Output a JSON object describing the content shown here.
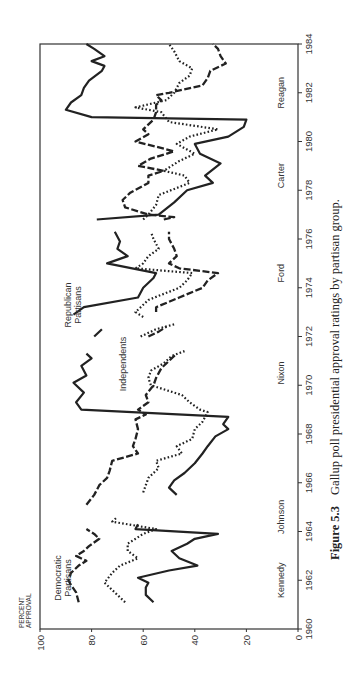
{
  "chart_data": {
    "type": "line",
    "title": "Gallup poll presidential approval ratings by partisan group.",
    "caption_label": "Figure 5.3",
    "caption_text": "Gallup poll presidential approval ratings by partisan group.",
    "ylabel": "PERCENT APPROVAL",
    "ylabel_lines": [
      "PERCENT",
      "APPROVAL"
    ],
    "xlabel": "",
    "xlim": [
      1960,
      1984
    ],
    "ylim": [
      0,
      100
    ],
    "x_ticks": [
      "1960",
      "1962",
      "1964",
      "1966",
      "1968",
      "1970",
      "1972",
      "1974",
      "1976",
      "1978",
      "1980",
      "1982",
      "1984"
    ],
    "y_ticks": [
      "0",
      "20",
      "40",
      "60",
      "80",
      "100"
    ],
    "grid": false,
    "orientation": "rotated 90° (page printed sideways)",
    "presidents": [
      {
        "name": "Kennedy",
        "year": 1962.0
      },
      {
        "name": "Johnson",
        "year": 1964.6
      },
      {
        "name": "Nixon",
        "year": 1970.5
      },
      {
        "name": "Ford",
        "year": 1974.6
      },
      {
        "name": "Carter",
        "year": 1978.6
      },
      {
        "name": "Reagan",
        "year": 1982.0
      }
    ],
    "series": [
      {
        "name": "Democratic Partisans",
        "label_lines": [
          "Democratic",
          "Partisans"
        ],
        "style": "dashed",
        "segments": [
          [
            [
              1961.1,
              85
            ],
            [
              1961.5,
              86
            ],
            [
              1961.8,
              88
            ],
            [
              1962.0,
              89
            ],
            [
              1962.3,
              88
            ],
            [
              1962.6,
              85
            ],
            [
              1962.8,
              82
            ],
            [
              1963.0,
              86
            ],
            [
              1963.2,
              83
            ],
            [
              1963.4,
              81
            ],
            [
              1963.7,
              77
            ],
            [
              1963.9,
              79
            ],
            [
              1964.1,
              82
            ]
          ],
          [
            [
              1964.3,
              81
            ]
          ],
          [
            [
              1965.1,
              82
            ],
            [
              1965.5,
              79
            ],
            [
              1965.9,
              77
            ],
            [
              1966.2,
              74
            ],
            [
              1966.5,
              73
            ],
            [
              1966.9,
              72
            ],
            [
              1967.2,
              62
            ],
            [
              1967.5,
              64
            ],
            [
              1967.8,
              63
            ],
            [
              1968.2,
              62
            ],
            [
              1968.6,
              63
            ],
            [
              1968.8,
              59
            ],
            [
              1969.0,
              62
            ],
            [
              1969.3,
              58
            ],
            [
              1969.6,
              59
            ],
            [
              1970.0,
              56
            ],
            [
              1970.3,
              55
            ],
            [
              1970.7,
              53
            ],
            [
              1971.0,
              50
            ],
            [
              1971.3,
              47
            ]
          ],
          [
            [
              1972.0,
              58
            ],
            [
              1972.2,
              54
            ],
            [
              1972.4,
              51
            ]
          ],
          [
            [
              1973.0,
              55
            ],
            [
              1973.2,
              55
            ],
            [
              1973.6,
              46
            ],
            [
              1974.0,
              37
            ],
            [
              1974.3,
              35
            ],
            [
              1974.6,
              31
            ],
            [
              1974.8,
              46
            ],
            [
              1975.0,
              50
            ],
            [
              1975.3,
              47
            ],
            [
              1975.6,
              48
            ],
            [
              1976.0,
              50
            ],
            [
              1976.3,
              50
            ]
          ],
          [
            [
              1976.8,
              52
            ],
            [
              1976.9,
              48
            ],
            [
              1977.0,
              58
            ],
            [
              1977.3,
              67
            ],
            [
              1977.6,
              68
            ],
            [
              1977.9,
              65
            ],
            [
              1978.3,
              58
            ],
            [
              1978.6,
              58
            ],
            [
              1978.8,
              52
            ],
            [
              1979.0,
              62
            ],
            [
              1979.3,
              57
            ],
            [
              1979.6,
              48
            ],
            [
              1980.0,
              63
            ],
            [
              1980.3,
              58
            ],
            [
              1980.5,
              60
            ],
            [
              1980.9,
              56
            ],
            [
              1981.2,
              55
            ],
            [
              1981.5,
              55
            ],
            [
              1981.7,
              53
            ],
            [
              1981.9,
              55
            ],
            [
              1982.0,
              50
            ],
            [
              1982.3,
              37
            ],
            [
              1982.6,
              35
            ],
            [
              1982.9,
              34
            ],
            [
              1983.2,
              28
            ],
            [
              1983.5,
              30
            ],
            [
              1983.8,
              31
            ],
            [
              1984.0,
              33
            ]
          ]
        ]
      },
      {
        "name": "Independents",
        "label_lines": [
          "Independents"
        ],
        "style": "dotted",
        "segments": [
          [
            [
              1961.1,
              67
            ],
            [
              1961.6,
              72
            ],
            [
              1961.9,
              75
            ],
            [
              1962.3,
              72
            ],
            [
              1962.6,
              69
            ],
            [
              1962.9,
              62
            ],
            [
              1963.2,
              66
            ],
            [
              1963.5,
              66
            ],
            [
              1963.9,
              60
            ],
            [
              1964.1,
              55
            ],
            [
              1964.4,
              72
            ],
            [
              1964.6,
              70
            ]
          ],
          [
            [
              1965.6,
              60
            ],
            [
              1965.9,
              59
            ],
            [
              1966.2,
              58
            ],
            [
              1966.6,
              54
            ],
            [
              1966.9,
              55
            ],
            [
              1967.2,
              45
            ],
            [
              1967.5,
              47
            ],
            [
              1967.8,
              41
            ],
            [
              1968.2,
              40
            ],
            [
              1968.5,
              37
            ],
            [
              1968.9,
              35
            ],
            [
              1969.0,
              38
            ],
            [
              1969.3,
              42
            ],
            [
              1969.6,
              45
            ],
            [
              1970.0,
              57
            ],
            [
              1970.3,
              58
            ],
            [
              1970.6,
              57
            ],
            [
              1970.9,
              52
            ],
            [
              1971.2,
              49
            ],
            [
              1971.4,
              44
            ]
          ],
          [
            [
              1972.0,
              61
            ],
            [
              1972.3,
              55
            ],
            [
              1972.5,
              48
            ]
          ],
          [
            [
              1972.8,
              60
            ],
            [
              1973.0,
              63
            ],
            [
              1973.5,
              58
            ],
            [
              1974.0,
              46
            ],
            [
              1974.3,
              43
            ],
            [
              1974.6,
              41
            ],
            [
              1974.8,
              63
            ],
            [
              1975.0,
              60
            ],
            [
              1975.3,
              58
            ],
            [
              1975.6,
              54
            ],
            [
              1976.0,
              56
            ],
            [
              1976.3,
              57
            ]
          ],
          [
            [
              1976.8,
              60
            ],
            [
              1977.0,
              58
            ],
            [
              1977.4,
              55
            ],
            [
              1977.8,
              54
            ],
            [
              1978.3,
              42
            ],
            [
              1978.6,
              44
            ],
            [
              1978.8,
              52
            ],
            [
              1979.2,
              46
            ],
            [
              1979.5,
              40
            ],
            [
              1979.9,
              47
            ],
            [
              1980.2,
              42
            ],
            [
              1980.5,
              31
            ],
            [
              1980.8,
              50
            ],
            [
              1981.2,
              53
            ],
            [
              1981.4,
              63
            ],
            [
              1981.7,
              51
            ],
            [
              1982.0,
              48
            ],
            [
              1982.4,
              46
            ],
            [
              1982.7,
              42
            ],
            [
              1983.0,
              41
            ],
            [
              1983.3,
              46
            ],
            [
              1983.7,
              48
            ],
            [
              1984.0,
              50
            ]
          ]
        ]
      },
      {
        "name": "Republican Partisans",
        "label_lines": [
          "Republican",
          "Partisans"
        ],
        "style": "solid",
        "segments": [
          [
            [
              1961.1,
              56
            ],
            [
              1961.4,
              59
            ],
            [
              1961.7,
              59
            ],
            [
              1961.9,
              58
            ],
            [
              1962.1,
              62
            ],
            [
              1962.4,
              50
            ],
            [
              1962.6,
              39
            ],
            [
              1962.9,
              46
            ],
            [
              1963.2,
              49
            ],
            [
              1963.5,
              43
            ],
            [
              1963.7,
              40
            ],
            [
              1963.9,
              31
            ],
            [
              1964.1,
              63
            ],
            [
              1964.3,
              62
            ]
          ],
          [
            [
              1965.5,
              47
            ],
            [
              1965.8,
              50
            ],
            [
              1966.1,
              48
            ],
            [
              1966.4,
              44
            ],
            [
              1966.8,
              40
            ],
            [
              1967.2,
              37
            ],
            [
              1967.5,
              35
            ],
            [
              1967.9,
              32
            ],
            [
              1968.2,
              27
            ],
            [
              1968.4,
              29
            ],
            [
              1968.7,
              27
            ],
            [
              1969.0,
              84
            ],
            [
              1969.3,
              86
            ],
            [
              1969.7,
              83
            ],
            [
              1970.1,
              87
            ],
            [
              1970.4,
              82
            ],
            [
              1970.8,
              84
            ],
            [
              1971.1,
              80
            ],
            [
              1971.3,
              82
            ]
          ],
          [
            [
              1972.0,
              79
            ],
            [
              1972.3,
              76
            ]
          ],
          [
            [
              1972.9,
              87
            ],
            [
              1973.2,
              83
            ],
            [
              1973.6,
              62
            ],
            [
              1974.0,
              60
            ],
            [
              1974.4,
              56
            ],
            [
              1974.6,
              55
            ],
            [
              1975.0,
              74
            ],
            [
              1975.3,
              66
            ],
            [
              1975.6,
              70
            ],
            [
              1975.9,
              69
            ],
            [
              1976.3,
              71
            ]
          ],
          [
            [
              1976.8,
              78
            ],
            [
              1977.0,
              54
            ],
            [
              1977.5,
              48
            ],
            [
              1978.0,
              43
            ],
            [
              1978.3,
              33
            ],
            [
              1978.6,
              36
            ],
            [
              1979.1,
              30
            ],
            [
              1979.5,
              38
            ],
            [
              1979.9,
              40
            ],
            [
              1980.2,
              27
            ],
            [
              1980.6,
              21
            ],
            [
              1980.9,
              20
            ],
            [
              1981.0,
              80
            ],
            [
              1981.3,
              90
            ],
            [
              1981.6,
              88
            ],
            [
              1981.9,
              84
            ],
            [
              1982.2,
              83
            ],
            [
              1982.5,
              81
            ],
            [
              1982.9,
              76
            ],
            [
              1983.1,
              75
            ],
            [
              1983.3,
              80
            ],
            [
              1983.5,
              75
            ],
            [
              1983.8,
              79
            ],
            [
              1984.0,
              82
            ]
          ]
        ]
      }
    ]
  },
  "labels": {
    "ylabel_line1": "PERCENT",
    "ylabel_line2": "APPROVAL",
    "democratic_line1": "Democratic",
    "democratic_line2": "Partisans",
    "republican_line1": "Republican",
    "republican_line2": "Partisans",
    "independents": "Independents",
    "caption_label": "Figure 5.3",
    "caption_text": "Gallup poll presidential approval ratings by partisan group."
  },
  "presidents": [
    "Kennedy",
    "Johnson",
    "Nixon",
    "Ford",
    "Carter",
    "Reagan"
  ],
  "x_ticks": [
    "1960",
    "1962",
    "1964",
    "1966",
    "1968",
    "1970",
    "1972",
    "1974",
    "1976",
    "1978",
    "1980",
    "1982",
    "1984"
  ],
  "y_ticks": [
    "0",
    "20",
    "40",
    "60",
    "80",
    "100"
  ]
}
